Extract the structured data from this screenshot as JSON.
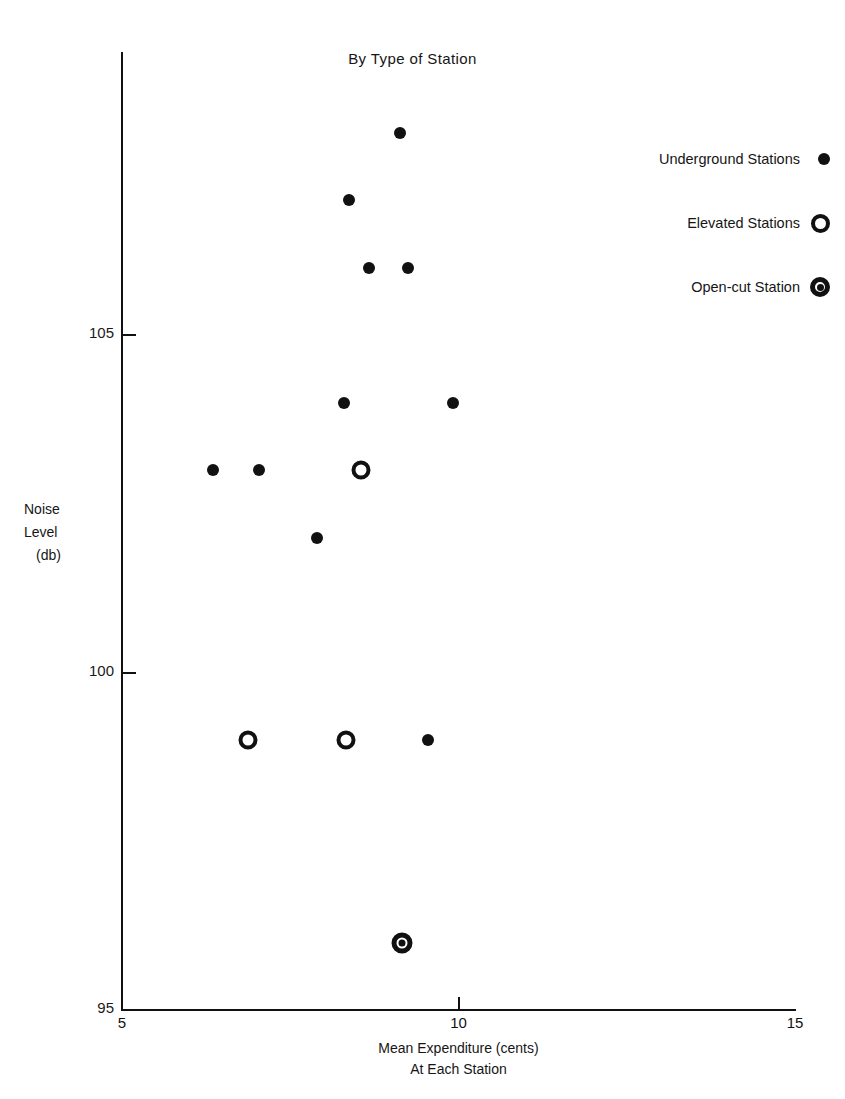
{
  "chart_data": {
    "type": "scatter",
    "title": "By Type of Station",
    "xlabel": "Mean Expenditure (cents)",
    "xlabel_line2": "At Each Station",
    "ylabel": "Noise",
    "ylabel_line2": "Level",
    "ylabel_line3": "(db)",
    "xlim": [
      5,
      15
    ],
    "ylim": [
      95,
      108.6
    ],
    "xticks": [
      5,
      10,
      15
    ],
    "xtick_labels": [
      "5",
      "10",
      "15"
    ],
    "yticks": [
      95,
      100,
      105
    ],
    "ytick_labels": [
      "95",
      "100",
      "105"
    ],
    "grid": false,
    "legend_position": "upper right",
    "marker_color": "#111111",
    "series": [
      {
        "name": "Underground Stations",
        "marker": "filled-circle",
        "points": [
          {
            "x": 9.13,
            "y": 108.0
          },
          {
            "x": 8.37,
            "y": 107.0
          },
          {
            "x": 8.67,
            "y": 106.0
          },
          {
            "x": 9.25,
            "y": 106.0
          },
          {
            "x": 8.3,
            "y": 104.0
          },
          {
            "x": 9.92,
            "y": 104.0
          },
          {
            "x": 6.35,
            "y": 103.0
          },
          {
            "x": 7.03,
            "y": 103.0
          },
          {
            "x": 7.9,
            "y": 102.0
          },
          {
            "x": 9.55,
            "y": 99.0
          }
        ]
      },
      {
        "name": "Elevated Stations",
        "marker": "open-circle",
        "points": [
          {
            "x": 8.55,
            "y": 103.0
          },
          {
            "x": 6.87,
            "y": 99.0
          },
          {
            "x": 8.33,
            "y": 99.0
          }
        ]
      },
      {
        "name": "Open-cut Station",
        "marker": "bullseye-circle",
        "points": [
          {
            "x": 9.16,
            "y": 96.0
          }
        ]
      }
    ]
  },
  "legend": {
    "items": [
      {
        "label": "Underground Stations",
        "marker": "filled-circle"
      },
      {
        "label": "Elevated Stations",
        "marker": "open-circle"
      },
      {
        "label": "Open-cut Station",
        "marker": "bullseye-circle"
      }
    ]
  }
}
